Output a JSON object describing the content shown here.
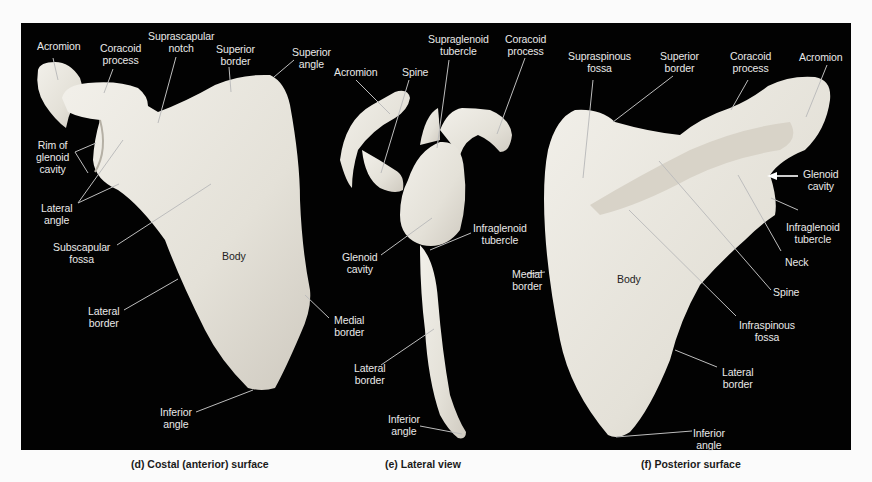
{
  "figure": {
    "panels": [
      {
        "id": "d",
        "caption": "(d) Costal (anterior) surface",
        "labels": {
          "acromion": "Acromion",
          "coracoid_process": "Coracoid\nprocess",
          "suprascapular_notch": "Suprascapular\nnotch",
          "superior_border": "Superior\nborder",
          "superior_angle": "Superior\nangle",
          "rim_of_glenoid_cavity": "Rim of\nglenoid\ncavity",
          "lateral_angle": "Lateral\nangle",
          "subscapular_fossa": "Subscapular\nfossa",
          "body": "Body",
          "lateral_border": "Lateral\nborder",
          "medial_border": "Medial\nborder",
          "inferior_angle": "Inferior\nangle"
        }
      },
      {
        "id": "e",
        "caption": "(e) Lateral view",
        "labels": {
          "acromion": "Acromion",
          "spine": "Spine",
          "supraglenoid_tubercle": "Supraglenoid\ntubercle",
          "coracoid_process": "Coracoid\nprocess",
          "glenoid_cavity": "Glenoid\ncavity",
          "infraglenoid_tubercle": "Infraglenoid\ntubercle",
          "lateral_border": "Lateral\nborder",
          "inferior_angle": "Inferior\nangle"
        }
      },
      {
        "id": "f",
        "caption": "(f) Posterior surface",
        "labels": {
          "supraspinous_fossa": "Supraspinous\nfossa",
          "superior_border": "Superior\nborder",
          "coracoid_process": "Coracoid\nprocess",
          "acromion": "Acromion",
          "glenoid_cavity": "Glenoid\ncavity",
          "infraglenoid_tubercle": "Infraglenoid\ntubercle",
          "neck": "Neck",
          "medial_border": "Medial\nborder",
          "body": "Body",
          "spine": "Spine",
          "infraspinous_fossa": "Infraspinous\nfossa",
          "lateral_border": "Lateral\nborder",
          "inferior_angle": "Inferior\nangle"
        }
      }
    ],
    "colors": {
      "background": "#020202",
      "bone": "#e6e3da",
      "label_text": "#e9e9e9",
      "leader_line": "#bdbdbd",
      "caption_text": "#1a1a1a"
    }
  }
}
